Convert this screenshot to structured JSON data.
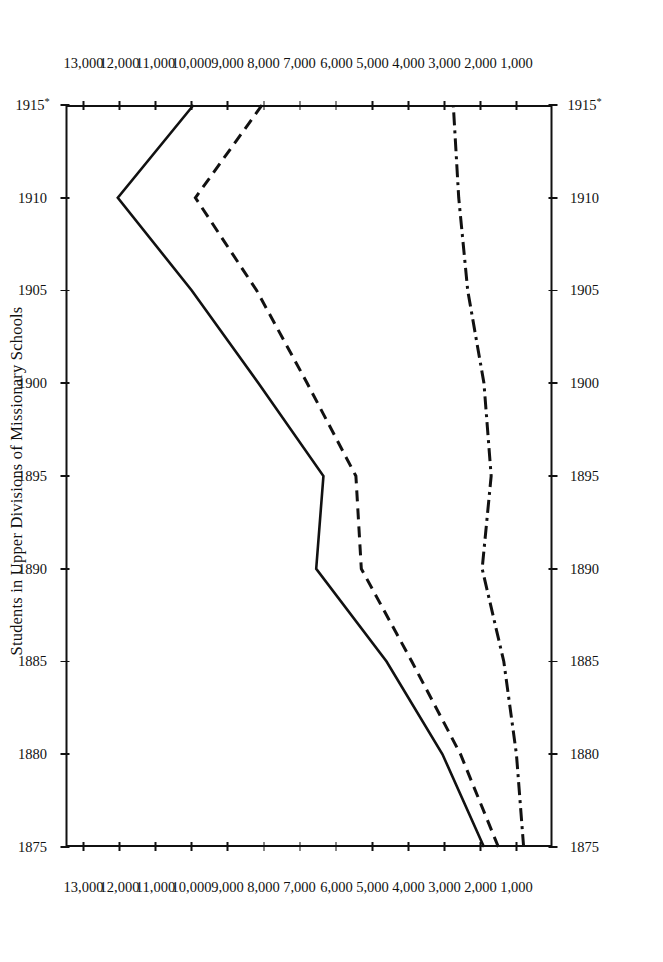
{
  "figure": {
    "title": "Students in Upper Divisions of Missionary Schools",
    "orientation": "rotated-90-ccw",
    "background": "#ffffff",
    "ink_color": "#111111"
  },
  "chart_data": {
    "type": "line",
    "title": "Students in Upper Divisions of Missionary Schools",
    "xlabel": "",
    "ylabel": "",
    "xlim": [
      1875,
      1915
    ],
    "ylim": [
      0,
      13500
    ],
    "grid": false,
    "legend": "none",
    "x": [
      1875,
      1880,
      1885,
      1890,
      1895,
      1900,
      1905,
      1910,
      1915
    ],
    "x_tick_labels": [
      "1875",
      "1880",
      "1885",
      "1890",
      "1895",
      "1900",
      "1905",
      "1910",
      "1915*"
    ],
    "y_ticks": [
      1000,
      2000,
      3000,
      4000,
      5000,
      6000,
      7000,
      8000,
      9000,
      10000,
      11000,
      12000,
      13000
    ],
    "y_tick_labels": [
      "1,000",
      "2,000",
      "3,000",
      "4,000",
      "5,000",
      "6,000",
      "7,000",
      "8,000",
      "9,000",
      "10,000",
      "11,000",
      "12,000",
      "13,000"
    ],
    "footnote_marker": "*",
    "series": [
      {
        "name": "Total",
        "style": "solid",
        "values": [
          1900,
          3050,
          4600,
          6550,
          6350,
          8150,
          10000,
          12050,
          9950
        ]
      },
      {
        "name": "Boys",
        "style": "dashed",
        "values": [
          1500,
          2550,
          3900,
          5300,
          5450,
          6800,
          8200,
          9900,
          8050
        ]
      },
      {
        "name": "Girls",
        "style": "dash-dot",
        "values": [
          800,
          1000,
          1350,
          1950,
          1700,
          1900,
          2350,
          2600,
          2750
        ]
      }
    ]
  },
  "axes": {
    "x_labels_bottom": [
      "1875",
      "1880",
      "1885",
      "1890",
      "1895",
      "1900",
      "1905",
      "1910",
      "1915*"
    ],
    "x_labels_top": [
      "1875",
      "1880",
      "1885",
      "1890",
      "1895",
      "1900",
      "1905",
      "1910",
      "1915*"
    ],
    "y_labels_left": [
      "13,000",
      "12,000",
      "11,000",
      "10,000",
      "9,000",
      "8,000",
      "7,000",
      "6,000",
      "5,000",
      "4,000",
      "3,000",
      "2,000",
      "1,000"
    ],
    "y_labels_right": [
      "13,000",
      "12,000",
      "11,000",
      "10,000",
      "9,000",
      "8,000",
      "7,000",
      "6,000",
      "5,000",
      "4,000",
      "3,000",
      "2,000",
      "1,000"
    ]
  }
}
